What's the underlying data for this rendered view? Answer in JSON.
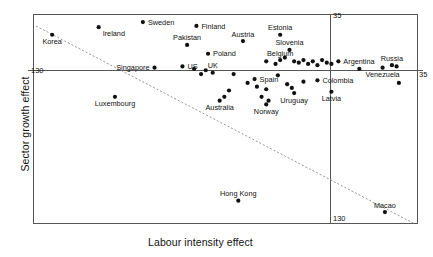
{
  "chart_data": {
    "type": "scatter",
    "title": "",
    "xlabel": "Labour intensity effect",
    "ylabel": "Sector growth effect",
    "xlim": [
      -130,
      35
    ],
    "ylim": [
      -130,
      35
    ],
    "grid": false,
    "legend": null,
    "axis_ticks": {
      "x": [
        "-130",
        "35"
      ],
      "y": [
        "-130",
        "35"
      ]
    },
    "tick_labels": {
      "y_upper_left": "130",
      "x_top_center": "35",
      "y_right": "35",
      "x_bottom_center": "130"
    },
    "reference_lines": [
      {
        "name": "vertical-divider",
        "orientation": "vertical",
        "x": 0
      },
      {
        "name": "horizontal-divider",
        "orientation": "horizontal",
        "y": 0
      }
    ],
    "trendline": {
      "style": "dotted",
      "from": [
        -130,
        35
      ],
      "to": [
        35,
        -130
      ]
    },
    "points": [
      {
        "label": "Korea",
        "x": -122,
        "y": 19,
        "label_pos": "below"
      },
      {
        "label": "Ireland",
        "x": -102,
        "y": 25,
        "label_pos": "right-below"
      },
      {
        "label": "Sweden",
        "x": -83,
        "y": 29,
        "label_pos": "right"
      },
      {
        "label": "Finland",
        "x": -60,
        "y": 26,
        "label_pos": "right"
      },
      {
        "label": "Pakistan",
        "x": -64,
        "y": 11,
        "label_pos": "above"
      },
      {
        "label": "Poland",
        "x": -55,
        "y": 4,
        "label_pos": "right"
      },
      {
        "label": "Estonia",
        "x": -24,
        "y": 19,
        "label_pos": "above"
      },
      {
        "label": "Austria",
        "x": -40,
        "y": 14,
        "label_pos": "above"
      },
      {
        "label": "Slovenia",
        "x": -20,
        "y": 7,
        "label_pos": "above"
      },
      {
        "label": "Singapore",
        "x": -78,
        "y": -7,
        "label_pos": "left"
      },
      {
        "label": "US",
        "x": -66,
        "y": -6,
        "label_pos": "right"
      },
      {
        "label": "UK",
        "x": -53,
        "y": -11,
        "label_pos": "above"
      },
      {
        "label": "Belgium",
        "x": -24,
        "y": -1,
        "label_pos": "above"
      },
      {
        "label": "Spain",
        "x": -35,
        "y": -16,
        "label_pos": "right"
      },
      {
        "label": "Luxembourg",
        "x": -95,
        "y": -30,
        "label_pos": "below"
      },
      {
        "label": "Australia",
        "x": -50,
        "y": -33,
        "label_pos": "below"
      },
      {
        "label": "Argentina",
        "x": 1,
        "y": -2,
        "label_pos": "right"
      },
      {
        "label": "Colombia",
        "x": -8,
        "y": -17,
        "label_pos": "right"
      },
      {
        "label": "Latvia",
        "x": -2,
        "y": -26,
        "label_pos": "below"
      },
      {
        "label": "Uruguay",
        "x": -18,
        "y": -27,
        "label_pos": "below"
      },
      {
        "label": "Norway",
        "x": -30,
        "y": -36,
        "label_pos": "below"
      },
      {
        "label": "Hong Kong",
        "x": -42,
        "y": -112,
        "label_pos": "above"
      },
      {
        "label": "Russia",
        "x": 24,
        "y": -5,
        "label_pos": "above"
      },
      {
        "label": "Venezuela",
        "x": 20,
        "y": -7,
        "label_pos": "below"
      },
      {
        "label": "Macao",
        "x": 21,
        "y": -121,
        "label_pos": "above"
      }
    ],
    "unlabelled_points": [
      {
        "x": -30,
        "y": -2
      },
      {
        "x": -26,
        "y": -4
      },
      {
        "x": -18,
        "y": -2
      },
      {
        "x": -16,
        "y": -3
      },
      {
        "x": -14,
        "y": -1
      },
      {
        "x": -12,
        "y": -4
      },
      {
        "x": -10,
        "y": -2
      },
      {
        "x": -8,
        "y": -5
      },
      {
        "x": -6,
        "y": -1
      },
      {
        "x": -4,
        "y": -3
      },
      {
        "x": -22,
        "y": 1
      },
      {
        "x": -2,
        "y": -4
      },
      {
        "x": -44,
        "y": -12
      },
      {
        "x": -38,
        "y": -19
      },
      {
        "x": -34,
        "y": -22
      },
      {
        "x": -30,
        "y": -24
      },
      {
        "x": -25,
        "y": -13
      },
      {
        "x": -21,
        "y": -20
      },
      {
        "x": -19,
        "y": -23
      },
      {
        "x": -14,
        "y": -18
      },
      {
        "x": -46,
        "y": -25
      },
      {
        "x": -56,
        "y": -9
      },
      {
        "x": -61,
        "y": -8
      },
      {
        "x": -58,
        "y": -12
      },
      {
        "x": -48,
        "y": -30
      },
      {
        "x": -32,
        "y": -30
      },
      {
        "x": -29,
        "y": -33
      },
      {
        "x": 10,
        "y": -8
      },
      {
        "x": 26,
        "y": -6
      },
      {
        "x": 27,
        "y": -19
      }
    ]
  }
}
